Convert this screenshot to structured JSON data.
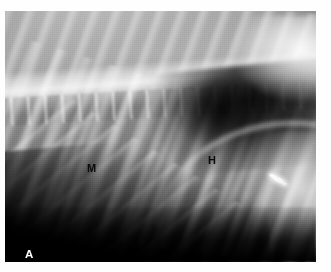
{
  "figure": {
    "type": "radiograph",
    "modality": "x-ray",
    "view": "lateral thoracic",
    "panel_label": "A",
    "panel_label_color": "#ffffff",
    "annotation_color": "#0a0a0a",
    "background_color": "#fefefe",
    "annotations": [
      {
        "id": "m",
        "label": "M",
        "color": "#0a0a0a",
        "x": 82,
        "y": 152
      },
      {
        "id": "h",
        "label": "H",
        "color": "#0a0a0a",
        "x": 203,
        "y": 144
      }
    ],
    "markers": [
      {
        "id": "linear-opacity",
        "label": "",
        "x": 263,
        "y": 166
      }
    ]
  },
  "plate": {
    "left": 5,
    "top": 11,
    "width": 311,
    "height": 251
  }
}
